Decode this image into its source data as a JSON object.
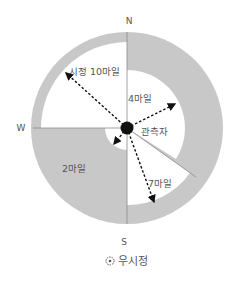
{
  "diagram": {
    "compass": {
      "north": "N",
      "south": "S",
      "west": "W"
    },
    "observer_label": "관측자",
    "labels": {
      "visibility_10": "시정 10마일",
      "visibility_4": "4마일",
      "visibility_2": "2마일",
      "visibility_7": "7마일"
    },
    "caption": "우시정",
    "colors": {
      "shaded": "#c8c8c8",
      "white": "#ffffff",
      "line": "#8a8a8a",
      "arrow": "#111111"
    }
  }
}
